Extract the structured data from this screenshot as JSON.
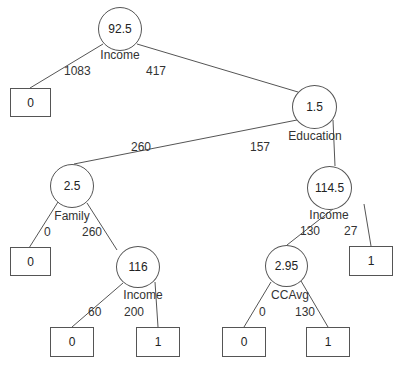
{
  "tree": {
    "root": {
      "threshold": "92.5",
      "variable": "Income",
      "left_count": "1083",
      "right_count": "417"
    },
    "leaf_root_left": {
      "value": "0"
    },
    "node_education": {
      "threshold": "1.5",
      "variable": "Education",
      "left_count": "260",
      "right_count": "157"
    },
    "node_family": {
      "threshold": "2.5",
      "variable": "Family",
      "left_count": "0",
      "right_count": "260"
    },
    "leaf_family_left": {
      "value": "0"
    },
    "node_income_116": {
      "threshold": "116",
      "variable": "Income",
      "left_count": "60",
      "right_count": "200"
    },
    "leaf_income116_left": {
      "value": "0"
    },
    "leaf_income116_right": {
      "value": "1"
    },
    "node_income_114": {
      "threshold": "114.5",
      "variable": "Income",
      "left_count": "130",
      "right_count": "27"
    },
    "leaf_income114_right": {
      "value": "1"
    },
    "node_ccavg": {
      "threshold": "2.95",
      "variable": "CCAvg",
      "left_count": "0",
      "right_count": "130"
    },
    "leaf_ccavg_left": {
      "value": "0"
    },
    "leaf_ccavg_right": {
      "value": "1"
    }
  },
  "colors": {
    "line": "#555555",
    "text": "#222222",
    "background": "#ffffff"
  }
}
